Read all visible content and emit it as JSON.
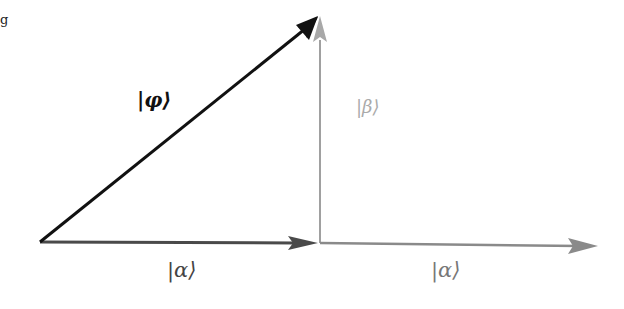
{
  "fragment": {
    "text": "g"
  },
  "diagram": {
    "vectors": [
      {
        "id": "phi",
        "label": "|φ⟩",
        "color": "#111111",
        "from": [
          40,
          242
        ],
        "to": [
          318,
          18
        ]
      },
      {
        "id": "alpha1",
        "label": "|α⟩",
        "color": "#555555",
        "from": [
          40,
          242
        ],
        "to": [
          318,
          242
        ]
      },
      {
        "id": "beta",
        "label": "|β⟩",
        "color": "#a0a0a0",
        "from": [
          320,
          242
        ],
        "to": [
          320,
          18
        ]
      },
      {
        "id": "alpha2",
        "label": "|α⟩",
        "color": "#8a8a8a",
        "from": [
          320,
          242
        ],
        "to": [
          598,
          246
        ]
      }
    ],
    "labels": {
      "phi": "|φ⟩",
      "beta": "|β⟩",
      "alpha_left": "|α⟩",
      "alpha_right": "|α⟩"
    }
  }
}
